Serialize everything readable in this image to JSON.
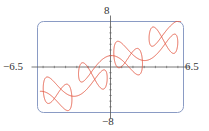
{
  "chart_data": {
    "type": "line",
    "title": "",
    "xlabel": "",
    "ylabel": "",
    "xlim": [
      -6.5,
      6.5
    ],
    "ylim": [
      -8,
      8
    ],
    "grid": false,
    "legend": null,
    "tick_labels": {
      "x_min": "−6.5",
      "x_max": "6.5",
      "y_max": "8",
      "y_min": "−8"
    },
    "x_ticks_minor": [
      -6,
      -5,
      -4,
      -3,
      -2,
      -1,
      1,
      2,
      3,
      4,
      5,
      6
    ],
    "y_ticks_minor": [
      -7,
      -6,
      -5,
      -4,
      -3,
      -2,
      -1,
      1,
      2,
      3,
      4,
      5,
      6,
      7
    ],
    "series": [
      {
        "name": "parametric curve",
        "parametric": {
          "x": "t + 2*sin(2t)",
          "y": "t + 2*cos(5t)",
          "t_range": [
            -6.283185307,
            6.283185307
          ],
          "coef_x": 2,
          "freq_x": 2,
          "coef_y": 2,
          "freq_y": 5
        },
        "color": "#e2553f"
      }
    ]
  },
  "style": {
    "frame_color": "#8a9bc4",
    "axis_color": "#555555",
    "curve_color": "#e2553f"
  }
}
